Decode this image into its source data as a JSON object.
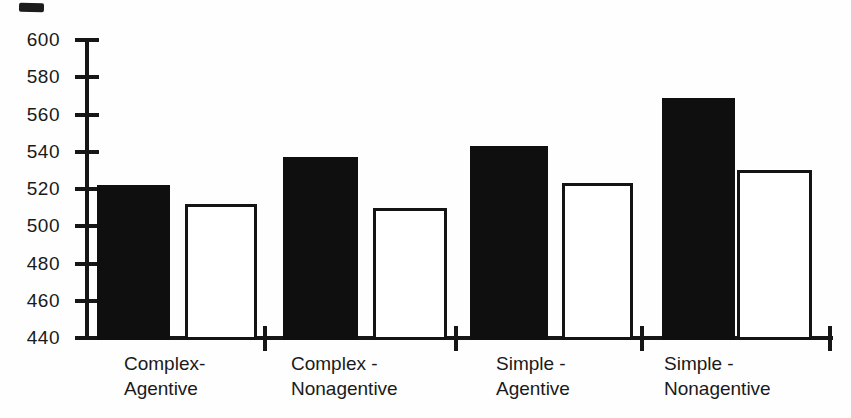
{
  "chart_data": {
    "type": "bar",
    "categories": [
      "Complex-Agentive",
      "Complex-Nonagentive",
      "Simple-Agentive",
      "Simple-Nonagentive"
    ],
    "category_labels": [
      {
        "line1": "Complex-",
        "line2": "Agentive"
      },
      {
        "line1": "Complex -",
        "line2": "Nonagentive"
      },
      {
        "line1": "Simple -",
        "line2": "Agentive"
      },
      {
        "line1": "Simple -",
        "line2": "Nonagentive"
      }
    ],
    "series": [
      {
        "name": "black-filled-bars",
        "fill": "#0f0f0f",
        "values": [
          522,
          537,
          543,
          569
        ]
      },
      {
        "name": "white-outlined-bars",
        "fill": "#ffffff",
        "values": [
          512,
          510,
          523,
          530
        ]
      }
    ],
    "ylim": [
      440,
      600
    ],
    "y_ticks": [
      600,
      580,
      560,
      540,
      520,
      500,
      480,
      460,
      440
    ],
    "xlabel": "",
    "ylabel": "",
    "legend": "none",
    "grid": false
  },
  "colors": {
    "ink": "#161616",
    "background": "#fefefe",
    "bar_black": "#0f0f0f",
    "bar_white_fill": "#ffffff"
  }
}
